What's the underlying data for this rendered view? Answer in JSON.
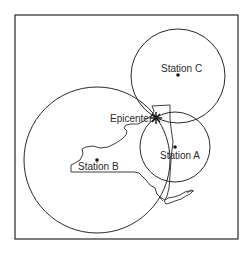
{
  "map": {
    "labels": {
      "station_a": "Station A",
      "station_b": "Station B",
      "station_c": "Station C",
      "epicenter": "Epicenter"
    },
    "colors": {
      "line": "#2a2a2a",
      "background": "#ffffff"
    }
  }
}
